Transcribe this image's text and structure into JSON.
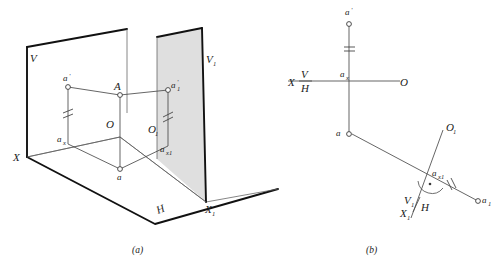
{
  "figure": {
    "caption_a": "(a)",
    "caption_b": "(b)"
  },
  "panel_a": {
    "name": "pictorial-view",
    "labels": {
      "v_plane": "V",
      "v1_plane": "V",
      "v1_plane_sub": "1",
      "h_plane": "H",
      "x_axis": "X",
      "x1_axis": "X",
      "x1_axis_sub": "1",
      "origin": "O",
      "origin1": "O",
      "origin1_sub": "1",
      "point_A": "A",
      "point_a_front": "a",
      "point_a_front_prime": "'",
      "point_a_top": "a",
      "point_ax": "a",
      "point_ax_sub": "x",
      "point_a1_front": "a",
      "point_a1_front_prime": "'",
      "point_a1_front_sub": "1",
      "point_ax1": "a",
      "point_ax1_sub": "x1"
    }
  },
  "panel_b": {
    "name": "orthographic-view",
    "labels": {
      "point_a_prime": "a",
      "point_a_prime_mark": "'",
      "point_a": "a",
      "point_ax": "a",
      "point_ax_sub": "x",
      "axis_x": "X",
      "axis_v": "V",
      "axis_h": "H",
      "origin": "O",
      "origin1": "O",
      "origin1_sub": "1",
      "point_ax1": "a",
      "point_ax1_sub": "x1",
      "point_a1": "a",
      "point_a1_sub": "1",
      "axis_v1": "V",
      "axis_v1_sub": "1",
      "axis_h1": "H",
      "axis_x1": "X",
      "axis_x1_sub": "1"
    }
  },
  "colors": {
    "line_dark": "#111111",
    "line_thin": "#5d5d5d",
    "plane_shade": "#d2d2d2",
    "text": "#1a1a1a",
    "node_fill": "#ffffff"
  }
}
